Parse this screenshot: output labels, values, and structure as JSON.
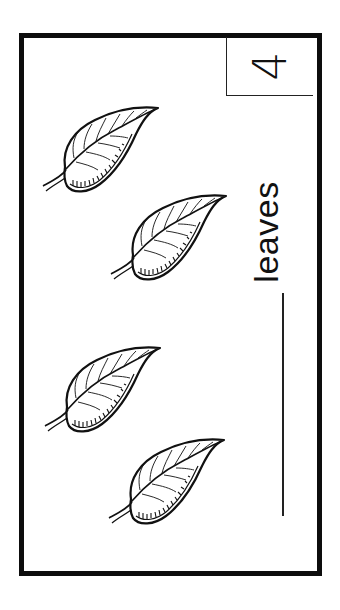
{
  "worksheet": {
    "number": "4",
    "label": "leaves",
    "answer_blank": "",
    "item_icon": "leaf-icon",
    "item_count": 4,
    "leaves": [
      {
        "id": 1,
        "x": 40,
        "y": 100
      },
      {
        "id": 2,
        "x": 108,
        "y": 188
      },
      {
        "id": 3,
        "x": 42,
        "y": 340
      },
      {
        "id": 4,
        "x": 106,
        "y": 432
      }
    ],
    "colors": {
      "ink": "#111111",
      "background": "#ffffff"
    }
  }
}
